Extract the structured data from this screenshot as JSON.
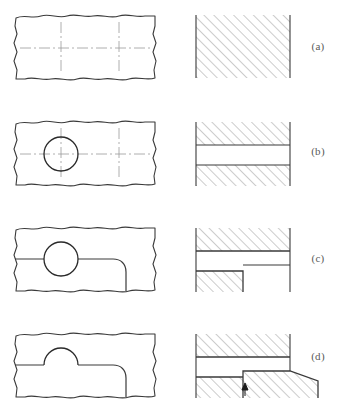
{
  "figure": {
    "background_color": "#ffffff",
    "line_color": "#3a3a3a",
    "hatch_color": "#8f8f8f",
    "centerline_color": "#9a9a9a",
    "label_color": "#5a5a5a",
    "width": 352,
    "height": 418,
    "rows": [
      {
        "id": "a",
        "label": "(a)",
        "label_x": 318,
        "label_y": 50,
        "plan_view": {
          "name": "plan-view-a",
          "description": "Rectangular plate bounded by freehand break lines with two crossed centerlines",
          "has_hole": false,
          "has_step": false,
          "centerline_count": 2
        },
        "section_view": {
          "name": "section-view-a",
          "description": "Solid rectangle fully cross hatched at 45 degrees",
          "regions": 1,
          "has_gap": false,
          "has_step": false
        }
      },
      {
        "id": "b",
        "label": "(b)",
        "label_x": 318,
        "label_y": 155,
        "plan_view": {
          "name": "plan-view-b",
          "description": "Plate with a circular hole on the left centerline crossing",
          "has_hole": true,
          "has_step": false,
          "centerline_count": 2
        },
        "section_view": {
          "name": "section-view-b",
          "description": "Two hatched bands separated by a clear horizontal gap representing the through hole",
          "regions": 2,
          "has_gap": true,
          "has_step": false
        }
      },
      {
        "id": "c",
        "label": "(c)",
        "label_x": 318,
        "label_y": 262,
        "plan_view": {
          "name": "plan-view-c",
          "description": "Plate with circular hole and a rounded step edge running to the right",
          "has_hole": true,
          "has_step": true,
          "centerline_count": 0
        },
        "section_view": {
          "name": "section-view-c",
          "description": "Upper hatched band full width, clear gap, lower hatched block ending at a step with outline continuing right",
          "regions": 2,
          "has_gap": true,
          "has_step": true
        }
      },
      {
        "id": "d",
        "label": "(d)",
        "label_x": 318,
        "label_y": 360,
        "plan_view": {
          "name": "plan-view-d",
          "description": "Plate with semicircular arc above the step line and rounded step edge",
          "has_hole": true,
          "has_step": true,
          "centerline_count": 0
        },
        "section_view": {
          "name": "section-view-d",
          "description": "Upper hatched band, clear gap, lower left hatched block and a raised stepped hatched boss to the right with a chamfered corner and an arrow mark",
          "regions": 3,
          "has_gap": true,
          "has_step": true,
          "has_arrow_marker": true
        }
      }
    ]
  }
}
